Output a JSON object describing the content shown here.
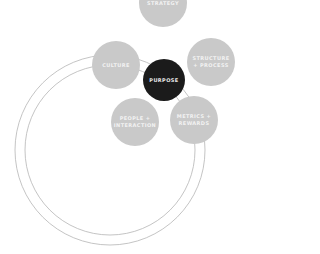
{
  "diagram": {
    "colors": {
      "node": "#c9c9c9",
      "center": "#1b1b1b",
      "ring": "#b5b5b5",
      "text": "#ffffff"
    },
    "rings": [
      {
        "name": "outer",
        "cx": 110,
        "cy": 150,
        "r": 95
      },
      {
        "name": "inner",
        "cx": 110,
        "cy": 150,
        "r": 85
      }
    ],
    "nodes": [
      {
        "id": "strategy",
        "label": "STRATEGY",
        "cx": 163,
        "cy": 3,
        "r": 24,
        "style": "gray"
      },
      {
        "id": "culture",
        "label": "CULTURE",
        "cx": 116,
        "cy": 65,
        "r": 24,
        "style": "gray"
      },
      {
        "id": "structure",
        "label": "STRUCTURE + PROCESS",
        "cx": 211,
        "cy": 62,
        "r": 24,
        "style": "gray"
      },
      {
        "id": "purpose",
        "label": "PURPOSE",
        "cx": 164,
        "cy": 80,
        "r": 21,
        "style": "dark"
      },
      {
        "id": "people",
        "label": "PEOPLE + INTERACTION",
        "cx": 135,
        "cy": 122,
        "r": 24,
        "style": "gray"
      },
      {
        "id": "metrics",
        "label": "METRICS + REWARDS",
        "cx": 194,
        "cy": 120,
        "r": 24,
        "style": "gray"
      }
    ]
  }
}
